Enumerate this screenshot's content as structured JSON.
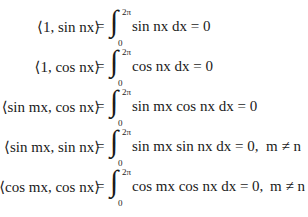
{
  "equations": [
    {
      "lhs": "⟨1, sin nx⟩",
      "equals": "=",
      "integral": "∫",
      "upper_limit": "2π",
      "lower_limit": "0",
      "integrand": "sin nx dx = 0",
      "condition": ""
    },
    {
      "lhs": "⟨1, cos nx⟩",
      "equals": "=",
      "integral": "∫",
      "upper_limit": "2π",
      "lower_limit": "0",
      "integrand": "cos nx dx = 0",
      "condition": ""
    },
    {
      "lhs": "⟨sin mx, cos nx⟩",
      "equals": "=",
      "integral": "∫",
      "upper_limit": "2π",
      "lower_limit": "0",
      "integrand": "sin mx cos nx dx = 0",
      "condition": ""
    },
    {
      "lhs": "⟨sin mx, sin nx⟩",
      "equals": "=",
      "integral": "∫",
      "upper_limit": "2π",
      "lower_limit": "0",
      "integrand": "sin mx sin nx dx = 0,",
      "condition": "m ≠ n"
    },
    {
      "lhs": "⟨cos mx, cos nx⟩",
      "equals": "=",
      "integral": "∫",
      "upper_limit": "2π",
      "lower_limit": "0",
      "integrand": "cos mx cos nx dx = 0,",
      "condition": "m ≠ n"
    }
  ]
}
